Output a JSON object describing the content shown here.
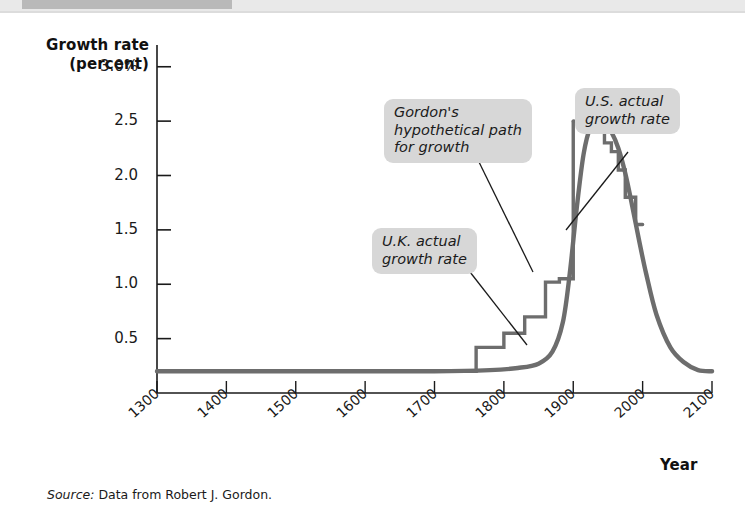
{
  "figure": {
    "source_note_lead": "Source:",
    "source_note_text": " Data from Robert J. Gordon."
  },
  "callouts": {
    "gordon": "Gordon's\nhypothetical path\nfor growth",
    "us": "U.S. actual\ngrowth rate",
    "uk": "U.K. actual\ngrowth rate"
  },
  "colors": {
    "curve": "#6d6d6d",
    "step": "#6d6d6d",
    "axis": "#1a1a1a",
    "callout_bg": "#d7d7d7",
    "leader": "#1a1a1a"
  },
  "chart_data": {
    "type": "line",
    "title": "",
    "xlabel": "Year",
    "ylabel": "Growth rate (percent)",
    "xlim": [
      1300,
      2100
    ],
    "ylim": [
      0,
      3.2
    ],
    "xticks": [
      1300,
      1400,
      1500,
      1600,
      1700,
      1800,
      1900,
      2000,
      2100
    ],
    "xticklabels": [
      "1300",
      "1400",
      "1500",
      "1600",
      "1700",
      "1800",
      "1900",
      "2000",
      "2100"
    ],
    "yticks": [
      0.5,
      1.0,
      1.5,
      2.0,
      2.5,
      3.0
    ],
    "yticklabels": [
      "0.5",
      "1.0",
      "1.5",
      "2.0",
      "2.5",
      "3.0%"
    ],
    "grid": false,
    "legend": "annotations",
    "series": [
      {
        "name": "Gordon's hypothetical path for growth",
        "style": "smooth",
        "x": [
          1300,
          1500,
          1700,
          1780,
          1820,
          1850,
          1870,
          1885,
          1895,
          1905,
          1915,
          1925,
          1935,
          1945,
          1955,
          1965,
          1975,
          1985,
          1995,
          2005,
          2020,
          2040,
          2060,
          2080,
          2100
        ],
        "values": [
          0.2,
          0.2,
          0.2,
          0.21,
          0.23,
          0.27,
          0.38,
          0.65,
          1.1,
          1.7,
          2.2,
          2.45,
          2.5,
          2.48,
          2.4,
          2.25,
          2.02,
          1.72,
          1.4,
          1.1,
          0.72,
          0.42,
          0.28,
          0.21,
          0.2
        ]
      },
      {
        "name": "U.K. actual growth rate",
        "style": "step",
        "x": [
          1300,
          1700,
          1760,
          1800,
          1830,
          1860,
          1880,
          1900
        ],
        "values": [
          0.2,
          0.2,
          0.42,
          0.55,
          0.7,
          1.02,
          1.05,
          2.5
        ]
      },
      {
        "name": "U.S. actual growth rate",
        "style": "step",
        "x": [
          1900,
          1930,
          1945,
          1955,
          1965,
          1975,
          1990,
          2000
        ],
        "values": [
          2.5,
          2.5,
          2.3,
          2.22,
          2.05,
          1.8,
          1.55,
          1.55
        ]
      }
    ]
  }
}
